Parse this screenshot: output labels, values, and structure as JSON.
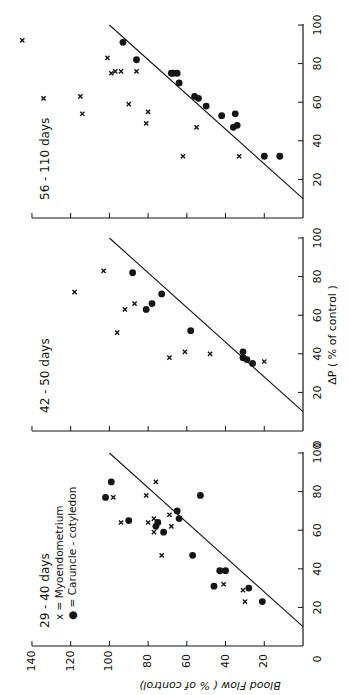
{
  "figure": {
    "ylabel": "Blood Flow ( % of control)",
    "xlabel": "ΔP ( % of control )",
    "legend": {
      "myo_label": "x = Myoendometrium",
      "car_label": "● = Caruncle - cotyledon"
    },
    "ink": "#141414"
  },
  "chart_data": [
    {
      "type": "scatter",
      "title": "29 - 40 days",
      "xlabel": "ΔP (% of control)",
      "ylabel": "Blood Flow (% of control)",
      "xlim": [
        0,
        100
      ],
      "ylim": [
        0,
        140
      ],
      "x_ticks": [
        20,
        40,
        60,
        80,
        100
      ],
      "y_ticks": [
        20,
        40,
        60,
        80,
        100,
        120,
        140
      ],
      "identity_line": {
        "from": [
          10,
          0
        ],
        "to": [
          100,
          100
        ]
      },
      "series": [
        {
          "name": "Myoendometrium",
          "marker": "x",
          "points": [
            [
              85,
              76
            ],
            [
              77,
              98
            ],
            [
              78,
              81
            ],
            [
              64,
              94
            ],
            [
              64,
              80
            ],
            [
              66,
              77
            ],
            [
              59,
              77
            ],
            [
              68,
              69
            ],
            [
              62,
              68
            ],
            [
              47,
              73
            ],
            [
              39,
              41
            ],
            [
              32,
              41
            ],
            [
              29,
              31
            ],
            [
              23,
              30
            ]
          ]
        },
        {
          "name": "Caruncle-cotyledon",
          "marker": "dot",
          "points": [
            [
              85,
              99
            ],
            [
              77,
              102
            ],
            [
              78,
              53
            ],
            [
              65,
              90
            ],
            [
              64,
              75
            ],
            [
              62,
              76
            ],
            [
              59,
              72
            ],
            [
              70,
              65
            ],
            [
              66,
              64
            ],
            [
              47,
              57
            ],
            [
              39,
              43
            ],
            [
              39,
              40
            ],
            [
              31,
              46
            ],
            [
              30,
              28
            ],
            [
              23,
              21
            ]
          ]
        }
      ]
    },
    {
      "type": "scatter",
      "title": "42 - 50 days",
      "xlabel": "ΔP (% of control)",
      "ylabel": "Blood Flow (% of control)",
      "xlim": [
        0,
        100
      ],
      "ylim": [
        0,
        140
      ],
      "x_ticks": [
        20,
        40,
        60,
        80,
        100
      ],
      "identity_line": {
        "from": [
          10,
          0
        ],
        "to": [
          100,
          100
        ]
      },
      "series": [
        {
          "name": "Myoendometrium",
          "marker": "x",
          "points": [
            [
              83,
              103
            ],
            [
              72,
              118
            ],
            [
              66,
              87
            ],
            [
              63,
              92
            ],
            [
              51,
              96
            ],
            [
              38,
              69
            ],
            [
              41,
              61
            ],
            [
              40,
              48
            ],
            [
              36,
              20
            ]
          ]
        },
        {
          "name": "Caruncle-cotyledon",
          "marker": "dot",
          "points": [
            [
              82,
              88
            ],
            [
              71,
              73
            ],
            [
              66,
              78
            ],
            [
              63,
              81
            ],
            [
              52,
              58
            ],
            [
              41,
              31
            ],
            [
              38,
              31
            ],
            [
              37,
              29
            ],
            [
              35,
              26
            ]
          ]
        }
      ]
    },
    {
      "type": "scatter",
      "title": "56 - 110 days",
      "xlabel": "ΔP (% of control)",
      "ylabel": "Blood Flow (% of control)",
      "xlim": [
        0,
        100
      ],
      "ylim": [
        0,
        140
      ],
      "x_ticks": [
        20,
        40,
        60,
        80,
        100
      ],
      "identity_line": {
        "from": [
          10,
          0
        ],
        "to": [
          100,
          100
        ]
      },
      "series": [
        {
          "name": "Myoendometrium",
          "marker": "x",
          "points": [
            [
              92,
              145
            ],
            [
              83,
              101
            ],
            [
              75,
              99
            ],
            [
              76,
              97
            ],
            [
              76,
              94
            ],
            [
              76,
              86
            ],
            [
              62,
              134
            ],
            [
              63,
              115
            ],
            [
              54,
              114
            ],
            [
              59,
              90
            ],
            [
              55,
              80
            ],
            [
              49,
              81
            ],
            [
              47,
              55
            ],
            [
              32,
              62
            ],
            [
              32,
              33
            ]
          ]
        },
        {
          "name": "Caruncle-cotyledon",
          "marker": "dot",
          "points": [
            [
              91,
              93
            ],
            [
              82,
              86
            ],
            [
              75,
              68
            ],
            [
              75,
              67
            ],
            [
              75,
              65
            ],
            [
              70,
              64
            ],
            [
              63,
              56
            ],
            [
              62,
              54
            ],
            [
              58,
              50
            ],
            [
              53,
              42
            ],
            [
              54,
              35
            ],
            [
              47,
              36
            ],
            [
              48,
              34
            ],
            [
              32,
              20
            ],
            [
              32,
              12
            ]
          ]
        }
      ]
    }
  ]
}
